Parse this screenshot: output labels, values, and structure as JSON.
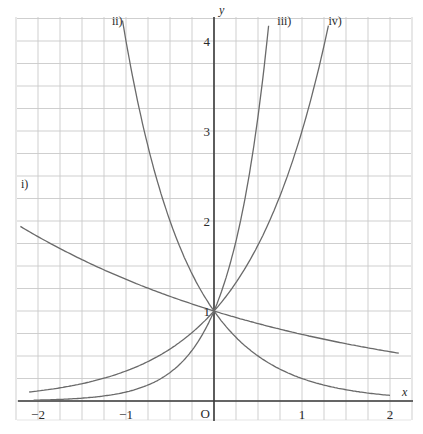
{
  "chart_data": {
    "type": "line",
    "title": "",
    "xlabel": "x",
    "ylabel": "y",
    "origin_label": "O",
    "xlim": [
      -2.25,
      2.25
    ],
    "ylim": [
      0,
      4.3
    ],
    "grid": true,
    "grid_step": 0.25,
    "x_ticks": [
      {
        "value": -2,
        "label": "−2"
      },
      {
        "value": -1,
        "label": "−1"
      },
      {
        "value": 1,
        "label": "1"
      },
      {
        "value": 2,
        "label": "2"
      }
    ],
    "y_ticks": [
      {
        "value": 1,
        "label": "1"
      },
      {
        "value": 2,
        "label": "2"
      },
      {
        "value": 3,
        "label": "3"
      },
      {
        "value": 4,
        "label": "4"
      }
    ],
    "series": [
      {
        "name": "i)",
        "base": 0.74,
        "x_range": [
          -2.2,
          2.1
        ],
        "label_pos": [
          -2.2,
          2.55
        ]
      },
      {
        "name": "ii)",
        "base": 0.25,
        "x_range": [
          -1.04,
          2.0
        ],
        "label_pos": [
          -1.16,
          4.18
        ]
      },
      {
        "name": "iii)",
        "base": 10,
        "x_range": [
          -2.05,
          0.62
        ],
        "label_pos": [
          0.72,
          4.18
        ]
      },
      {
        "name": "iv)",
        "base": 3,
        "x_range": [
          -2.1,
          1.3
        ],
        "label_pos": [
          1.3,
          4.18
        ]
      }
    ],
    "intersection_point": {
      "x": 0,
      "y": 1
    }
  },
  "colors": {
    "grid": "#c9c9c9",
    "axis": "#3a3a3a",
    "curve": "#6a6a6a",
    "text": "#2a2a2a"
  }
}
